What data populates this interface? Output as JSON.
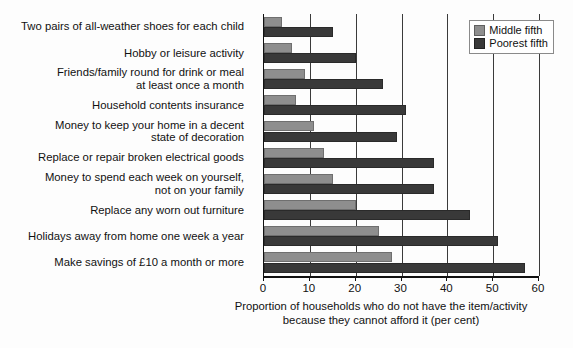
{
  "legend": {
    "items": [
      {
        "label": "Middle fifth",
        "color": "#8e8e8e",
        "icon": "square-swatch-icon"
      },
      {
        "label": "Poorest fifth",
        "color": "#393939",
        "icon": "square-swatch-icon"
      }
    ]
  },
  "axis": {
    "ticks": [
      "0",
      "10",
      "20",
      "30",
      "40",
      "50",
      "60"
    ],
    "title_line1": "Proportion of households who do not have the item/activity",
    "title_line2": "because they cannot afford it (per cent)"
  },
  "chart_data": {
    "type": "bar",
    "orientation": "horizontal",
    "title": "",
    "subtitle": "",
    "xlabel": "Proportion of households who do not have the item/activity because they cannot afford it (per cent)",
    "ylabel": "",
    "xlim": [
      0,
      60
    ],
    "xticks": [
      0,
      10,
      20,
      30,
      40,
      50,
      60
    ],
    "grid": "vertical gridlines at every 10 units",
    "legend_position": "top-right",
    "categories": [
      "Two pairs of all-weather shoes for each child",
      "Hobby or leisure activity",
      "Friends/family round for drink or meal at least once a month",
      "Household contents insurance",
      "Money to keep your home in a decent state of decoration",
      "Replace or repair broken electrical goods",
      "Money to spend each week on yourself, not on your family",
      "Replace any worn out furniture",
      "Holidays away from home one week a year",
      "Make savings of £10 a month or more"
    ],
    "category_lines": [
      [
        "Two pairs of all-weather shoes for each child"
      ],
      [
        "Hobby or leisure activity"
      ],
      [
        "Friends/family round for drink or meal",
        "at least once a month"
      ],
      [
        "Household contents insurance"
      ],
      [
        "Money to keep your home in a decent",
        "state of decoration"
      ],
      [
        "Replace or repair broken electrical goods"
      ],
      [
        "Money to spend each week on yourself,",
        "not on your family"
      ],
      [
        "Replace any worn out furniture"
      ],
      [
        "Holidays away from home one week a year"
      ],
      [
        "Make savings of £10 a month or more"
      ]
    ],
    "series": [
      {
        "name": "Middle fifth",
        "color": "#8e8e8e",
        "values": [
          4,
          6,
          9,
          7,
          11,
          13,
          15,
          20,
          25,
          28
        ]
      },
      {
        "name": "Poorest fifth",
        "color": "#393939",
        "values": [
          15,
          20,
          26,
          31,
          29,
          37,
          37,
          45,
          51,
          57
        ]
      }
    ]
  }
}
